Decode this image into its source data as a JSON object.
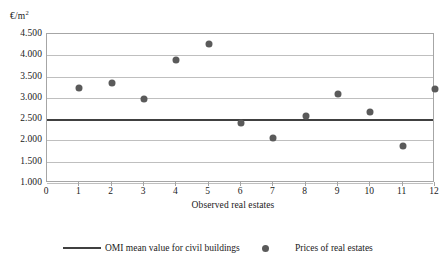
{
  "chart_data": {
    "type": "scatter",
    "title": "",
    "xlabel": "Observed real estates",
    "ylabel": "€/m²",
    "ylabel_unit_base": "€/m",
    "ylabel_unit_sup": "2",
    "xlim": [
      0,
      12
    ],
    "ylim": [
      1000,
      4500
    ],
    "grid": true,
    "legend_position": "bottom",
    "x_ticks": [
      "0",
      "1",
      "2",
      "3",
      "4",
      "5",
      "6",
      "7",
      "8",
      "9",
      "10",
      "11",
      "12"
    ],
    "x_tick_values": [
      0,
      1,
      2,
      3,
      4,
      5,
      6,
      7,
      8,
      9,
      10,
      11,
      12
    ],
    "y_ticks": [
      "1.000",
      "1.500",
      "2.000",
      "2.500",
      "3.000",
      "3.500",
      "4.000",
      "4.500"
    ],
    "y_tick_values": [
      1000,
      1500,
      2000,
      2500,
      3000,
      3500,
      4000,
      4500
    ],
    "series": [
      {
        "name": "Prices of real estates",
        "type": "scatter",
        "marker": "circle",
        "color": "#5a5a5a",
        "x": [
          1,
          2,
          3,
          4,
          5,
          6,
          7,
          8,
          9,
          10,
          11,
          12
        ],
        "values": [
          3230,
          3350,
          2980,
          3880,
          4270,
          2420,
          2050,
          2570,
          3100,
          2670,
          1880,
          3200
        ]
      },
      {
        "name": "OMI mean value for civil buildings",
        "type": "line",
        "color": "#404040",
        "constant_value": 2500
      }
    ],
    "legend": [
      {
        "label": "OMI mean value for civil buildings",
        "marker": "line",
        "color": "#404040"
      },
      {
        "label": "Prices of real estates",
        "marker": "circle",
        "color": "#5a5a5a"
      }
    ],
    "colors": {
      "marker": "#5a5a5a",
      "reference_line": "#404040",
      "gridline": "#bfbfbf",
      "frame": "#a6a6a6",
      "background": "#ffffff"
    }
  }
}
